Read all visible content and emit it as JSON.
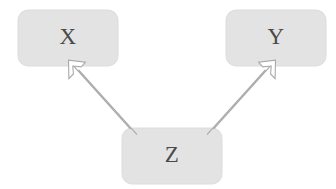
{
  "diagram": {
    "type": "causal-graph",
    "title": "",
    "background_color": "#ffffff",
    "node_fill_color": "#e2e2e2",
    "node_text_color": "#4a4a4a",
    "edge_color": "#9a9a9a",
    "dashed_edge_color": "#999999",
    "nodes": [
      {
        "id": "X",
        "label": "X",
        "x": 18,
        "y": 10,
        "width": 100,
        "height": 56,
        "corner_radius": 10
      },
      {
        "id": "Y",
        "label": "Y",
        "x": 226,
        "y": 10,
        "width": 100,
        "height": 56,
        "corner_radius": 10
      },
      {
        "id": "Z",
        "label": "Z",
        "x": 122,
        "y": 128,
        "width": 100,
        "height": 56,
        "corner_radius": 10
      }
    ],
    "edges": [
      {
        "id": "x-y",
        "from": "X",
        "to": "Y",
        "style": "dashed",
        "arrow": "none",
        "dash_length": 12,
        "gap_length": 9,
        "x1": 110,
        "y1": 38,
        "x2": 232,
        "y2": 38
      },
      {
        "id": "z-x",
        "from": "Z",
        "to": "X",
        "style": "hollow-outline",
        "arrow": "to-target",
        "x1": 133,
        "y1": 131,
        "x2": 72,
        "y2": 64
      },
      {
        "id": "z-y",
        "from": "Z",
        "to": "Y",
        "style": "hollow-outline",
        "arrow": "to-target",
        "x1": 211,
        "y1": 131,
        "x2": 272,
        "y2": 64
      }
    ]
  }
}
